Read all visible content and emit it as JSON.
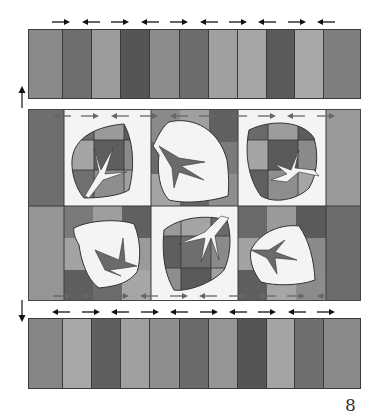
{
  "page_number": "8",
  "top_strip": {
    "stripes": [
      {
        "width": 34,
        "color": "#8a8a8a"
      },
      {
        "width": 29,
        "color": "#6e6e6e"
      },
      {
        "width": 30,
        "color": "#9b9b9b"
      },
      {
        "width": 29,
        "color": "#555555"
      },
      {
        "width": 30,
        "color": "#8c8c8c"
      },
      {
        "width": 29,
        "color": "#6c6c6c"
      },
      {
        "width": 29,
        "color": "#a0a0a0"
      },
      {
        "width": 29,
        "color": "#a6a6a6"
      },
      {
        "width": 29,
        "color": "#5a5a5a"
      },
      {
        "width": 29,
        "color": "#a8a8a8"
      },
      {
        "width": 36,
        "color": "#7e7e7e"
      }
    ],
    "arrows": [
      "right",
      "left",
      "right",
      "left",
      "right",
      "left",
      "right",
      "left",
      "right",
      "left"
    ]
  },
  "bottom_strip": {
    "stripes": [
      {
        "width": 34,
        "color": "#858585"
      },
      {
        "width": 29,
        "color": "#a8a8a8"
      },
      {
        "width": 30,
        "color": "#5f5f5f"
      },
      {
        "width": 29,
        "color": "#a0a0a0"
      },
      {
        "width": 30,
        "color": "#8e8e8e"
      },
      {
        "width": 29,
        "color": "#6a6a6a"
      },
      {
        "width": 29,
        "color": "#959595"
      },
      {
        "width": 29,
        "color": "#555555"
      },
      {
        "width": 29,
        "color": "#a4a4a4"
      },
      {
        "width": 29,
        "color": "#6f6f6f"
      },
      {
        "width": 36,
        "color": "#8a8a8a"
      }
    ],
    "arrows": [
      "left",
      "right",
      "left",
      "right",
      "left",
      "right",
      "left",
      "right",
      "left",
      "right"
    ]
  },
  "side_arrows": {
    "top_left": "up",
    "bottom_left": "down"
  },
  "middle_panel": {
    "leaves": 6,
    "rows": 2,
    "columns": 3
  }
}
